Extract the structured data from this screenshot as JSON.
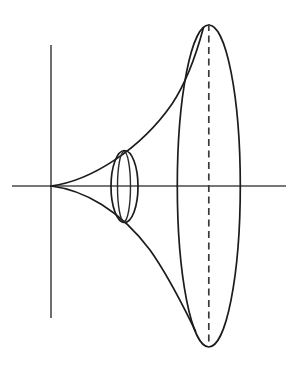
{
  "figure": {
    "type": "geometric-diagram",
    "background_color": "#ffffff",
    "stroke_color": "#1c1c1c",
    "axis_color": "#4a4a4a",
    "dashed_color": "#3a3a3a",
    "canvas": {
      "width": 302,
      "height": 383
    }
  },
  "axes": {
    "horizontal": {
      "name": "axis-of-revolution",
      "x1": 12,
      "y1": 186,
      "x2": 286,
      "y2": 186,
      "style": "solid"
    },
    "vertical": {
      "name": "vertical-axis",
      "x1": 51,
      "y1": 45,
      "x2": 51,
      "y2": 318,
      "style": "solid"
    }
  },
  "cusp_point": {
    "x": 51,
    "y": 186,
    "label": "cusp"
  },
  "profile": {
    "upper": {
      "name": "upper-profile-curve",
      "path": "M 51 186 C 90 181 140 150 172 104 C 188 80 198 48 203.5 27.5"
    },
    "lower": {
      "name": "lower-profile-curve",
      "path": "M 51 186 C 84 190 120 210 150 250 C 170 278 186 312 195.5 331"
    }
  },
  "small_cross_section": {
    "name": "small-cross-section-ellipse",
    "cx": 124.5,
    "cy": 186.5,
    "rx": 13.5,
    "ry": 36,
    "inner_lens_rx": 6.5,
    "description": "near cross-sectional circle shown in perspective"
  },
  "large_cross_section": {
    "name": "large-cross-section-ellipse",
    "cx": 208.8,
    "cy": 186,
    "rx": 31.5,
    "ry": 161,
    "description": "far cross-sectional circle shown in perspective"
  },
  "center_dashed_line": {
    "name": "ellipse-minor-axis-dashed",
    "x": 208.8,
    "y_top": 24,
    "y_bottom": 346,
    "style": "dashed",
    "dash_length": 7,
    "gap_length": 4.5
  }
}
